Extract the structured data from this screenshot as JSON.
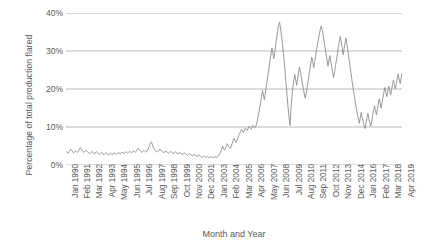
{
  "chart_data": {
    "type": "line",
    "title": "",
    "xlabel": "Month and Year",
    "ylabel": "Percentage of total production flared",
    "ylim": [
      0,
      40
    ],
    "ytick_labels": [
      "0%",
      "10%",
      "20%",
      "30%",
      "40%"
    ],
    "ytick_values": [
      0,
      10,
      20,
      30,
      40
    ],
    "grid": true,
    "legend": "none",
    "line_color": "#8c8c8c",
    "axis_color": "#a6a6a6",
    "text_color": "#595959",
    "xtick_labels": [
      "Jan 1990",
      "Feb 1991",
      "Mar 1992",
      "Apr 1993",
      "May 1994",
      "Jun 1995",
      "Jul 1996",
      "Aug 1997",
      "Sep 1998",
      "Oct 1999",
      "Nov 2000",
      "Dec 2001",
      "Jan 2003",
      "Feb 2004",
      "Mar 2005",
      "Apr 2006",
      "May 2007",
      "Jun 2008",
      "Jul 2009",
      "Aug 2010",
      "Sep 2011",
      "Oct 2012",
      "Nov 2013",
      "Dec 2014",
      "Jan 2016",
      "Feb 2017",
      "Mar 2018",
      "Apr 2019"
    ],
    "xtick_positions_months": [
      0,
      13,
      26,
      39,
      52,
      65,
      78,
      91,
      104,
      117,
      130,
      143,
      156,
      169,
      182,
      195,
      208,
      221,
      234,
      247,
      260,
      273,
      286,
      299,
      312,
      325,
      338,
      351
    ],
    "x_range_months": [
      0,
      351
    ],
    "series": [
      {
        "name": "Percentage of total production flared",
        "x_start": "Jan 1990",
        "x_end": "Apr 2019",
        "x_step": "monthly",
        "values": [
          3.6,
          3.3,
          3.1,
          3.4,
          3.8,
          4.2,
          3.9,
          3.5,
          3.2,
          3.4,
          3.7,
          3.5,
          3.3,
          3.6,
          4.1,
          4.6,
          4.2,
          3.8,
          3.5,
          3.3,
          3.6,
          3.9,
          3.6,
          3.4,
          3.2,
          3.0,
          3.3,
          3.6,
          3.4,
          3.1,
          2.9,
          3.2,
          3.5,
          3.3,
          3.0,
          2.8,
          3.0,
          3.3,
          3.1,
          2.9,
          2.7,
          3.0,
          3.2,
          3.0,
          2.8,
          2.6,
          2.9,
          3.1,
          2.9,
          2.7,
          2.9,
          3.2,
          3.0,
          2.8,
          3.0,
          3.3,
          3.1,
          2.9,
          3.1,
          3.4,
          3.2,
          3.0,
          3.2,
          3.5,
          3.3,
          3.1,
          3.3,
          3.6,
          3.4,
          3.2,
          3.4,
          3.7,
          3.5,
          3.3,
          3.6,
          4.0,
          4.4,
          4.1,
          3.8,
          3.5,
          3.3,
          3.6,
          3.9,
          3.6,
          3.4,
          3.6,
          4.0,
          4.5,
          5.2,
          5.8,
          6.1,
          5.4,
          4.7,
          4.2,
          3.9,
          3.6,
          3.4,
          3.6,
          3.9,
          4.2,
          3.9,
          3.6,
          3.4,
          3.2,
          3.4,
          3.7,
          3.5,
          3.3,
          3.1,
          3.3,
          3.6,
          3.4,
          3.2,
          3.0,
          3.2,
          3.5,
          3.3,
          3.1,
          2.9,
          3.1,
          3.3,
          3.1,
          2.9,
          2.7,
          2.9,
          3.2,
          3.0,
          2.8,
          2.6,
          2.8,
          3.0,
          2.8,
          2.6,
          2.4,
          2.6,
          2.8,
          2.6,
          2.4,
          2.2,
          2.4,
          2.6,
          2.4,
          2.2,
          2.0,
          2.2,
          2.4,
          2.2,
          2.0,
          2.1,
          2.3,
          2.1,
          1.9,
          2.0,
          2.2,
          2.0,
          1.9,
          2.0,
          2.2,
          2.1,
          2.0,
          2.2,
          2.6,
          3.0,
          3.4,
          4.2,
          5.0,
          4.4,
          3.9,
          4.3,
          5.1,
          5.6,
          5.1,
          4.6,
          4.3,
          4.8,
          5.6,
          6.4,
          7.0,
          6.4,
          5.9,
          6.3,
          7.1,
          7.8,
          8.3,
          8.8,
          9.4,
          9.0,
          8.6,
          9.1,
          9.7,
          9.4,
          9.1,
          9.6,
          10.2,
          9.8,
          9.5,
          9.9,
          10.4,
          10.1,
          9.8,
          10.2,
          11.0,
          12.2,
          13.6,
          15.0,
          16.4,
          18.0,
          19.6,
          18.4,
          17.2,
          18.8,
          20.6,
          22.4,
          24.0,
          25.8,
          27.6,
          29.2,
          30.8,
          29.4,
          28.0,
          29.8,
          31.8,
          33.6,
          35.2,
          36.8,
          37.6,
          36.0,
          34.2,
          32.0,
          29.6,
          27.0,
          24.0,
          21.0,
          18.0,
          15.0,
          12.5,
          10.4,
          14.8,
          18.0,
          20.4,
          22.2,
          23.8,
          22.4,
          21.0,
          22.6,
          24.2,
          25.8,
          24.4,
          23.0,
          21.6,
          20.2,
          18.8,
          17.6,
          18.8,
          20.4,
          22.0,
          23.6,
          25.2,
          26.8,
          28.4,
          27.0,
          25.6,
          27.2,
          28.8,
          30.4,
          31.8,
          33.2,
          34.6,
          35.8,
          36.6,
          35.4,
          34.0,
          32.4,
          30.8,
          29.2,
          27.6,
          26.0,
          27.4,
          28.8,
          27.2,
          25.8,
          24.4,
          23.0,
          24.6,
          26.2,
          27.8,
          29.4,
          31.0,
          32.6,
          33.8,
          32.4,
          30.8,
          29.0,
          30.6,
          32.2,
          33.4,
          31.8,
          30.0,
          28.2,
          26.4,
          24.6,
          22.8,
          21.0,
          19.4,
          17.8,
          16.2,
          14.8,
          13.4,
          12.2,
          11.0,
          12.4,
          13.8,
          12.6,
          11.4,
          10.4,
          9.6,
          10.8,
          12.2,
          13.6,
          12.4,
          11.2,
          10.2,
          11.4,
          12.8,
          14.2,
          15.6,
          14.4,
          13.2,
          14.6,
          16.0,
          17.4,
          16.2,
          15.0,
          16.4,
          17.8,
          19.2,
          20.4,
          19.2,
          18.0,
          19.4,
          20.8,
          19.6,
          18.4,
          19.8,
          21.2,
          22.4,
          21.2,
          20.0,
          21.4,
          22.8,
          24.0,
          22.6,
          21.4,
          22.8,
          24.2
        ]
      }
    ]
  }
}
